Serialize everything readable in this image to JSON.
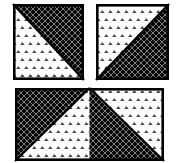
{
  "figure": {
    "canvas": {
      "width": 176,
      "height": 163,
      "background": "#ffffff"
    },
    "border": {
      "color": "#000000",
      "width": 2.6
    },
    "diagonal": {
      "color": "#000000",
      "width": 2.4
    },
    "fills": {
      "lattice": {
        "label": "black-diamond-lattice-fill",
        "background": "#050505",
        "line_color": "#7a7a7a",
        "dot_color": "#939393",
        "cell": 6
      },
      "specks": {
        "label": "white-triangle-specks-fill",
        "background": "#ffffff",
        "speck_color": "#454545",
        "speck_highlight": "#a2a2a2",
        "tile_w": 8,
        "tile_h": 16
      }
    },
    "blocks": [
      {
        "id": "top-left-square",
        "x": 13,
        "y": 4,
        "width": 71,
        "height": 76,
        "cells": [
          {
            "black_corner": "upper-right",
            "diagonal": "tl-br"
          }
        ]
      },
      {
        "id": "top-right-square",
        "x": 96,
        "y": 4,
        "width": 73,
        "height": 76,
        "cells": [
          {
            "black_corner": "lower-right",
            "diagonal": "bl-tr"
          }
        ]
      },
      {
        "id": "bottom-rectangle",
        "x": 15,
        "y": 88,
        "width": 149,
        "height": 73,
        "cells": [
          {
            "black_corner": "upper-left",
            "diagonal": "tr-bl"
          },
          {
            "black_corner": "lower-left",
            "diagonal": "tl-br"
          }
        ]
      }
    ]
  }
}
